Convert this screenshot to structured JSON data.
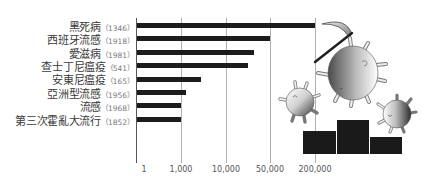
{
  "chart_data": {
    "type": "bar",
    "orientation": "horizontal",
    "title": "",
    "xlabel": "",
    "ylabel": "",
    "categories": [
      "黑死病",
      "西班牙流感",
      "愛滋病",
      "查士丁尼瘟疫",
      "安東尼瘟疫",
      "亞洲型流感",
      "流感",
      "第三次霍亂大流行"
    ],
    "category_years": [
      "（1346）",
      "（1918）",
      "（1981）",
      "（541）",
      "（165）",
      "（1956）",
      "（1968）",
      "（1852）"
    ],
    "values": [
      200000,
      50000,
      35000,
      30000,
      5000,
      2000,
      1000,
      1000
    ],
    "x_ticks": [
      "1",
      "1,000",
      "10,000",
      "50,000",
      "200,000"
    ],
    "x_tick_values": [
      1,
      1000,
      10000,
      50000,
      200000
    ],
    "xlim": [
      1,
      200000
    ],
    "x_scale": "piecewise (equal spacing between ticks)",
    "grid": "vertical lines at ticks",
    "legend": null,
    "bar_color": "#1c1c1c"
  },
  "illustration": {
    "icon": "viruses-with-scythe-on-podium-icon",
    "podium_color": "#1a1a1a"
  }
}
